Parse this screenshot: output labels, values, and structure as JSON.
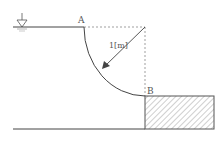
{
  "diagram": {
    "labels": {
      "point_a": "A",
      "point_b": "B",
      "radius": "1[m]"
    },
    "symbols": {
      "water_surface": "water-surface-icon"
    },
    "colors": {
      "line": "#444444",
      "dashed": "#777777",
      "hatch": "#999999",
      "text": "#555555"
    }
  }
}
